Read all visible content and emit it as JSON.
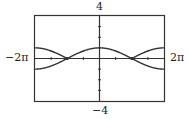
{
  "chart_data": {
    "type": "line",
    "title": "",
    "xlabel": "",
    "ylabel": "",
    "xlim": [
      -6.2832,
      6.2832
    ],
    "ylim": [
      -4,
      4
    ],
    "x_tick_spacing": 1.5708,
    "y_tick_spacing": 1,
    "grid": false,
    "series": [
      {
        "name": "upper curve",
        "expr": "|cos(x/2)|",
        "description": "peaks at 1 at x=0, touches 0 at x=±π, rises to 1 at x=±2π"
      },
      {
        "name": "lower curve",
        "expr": "cos(x/2) for |x|≥π",
        "description": "from 0 at x=±π descends to -1 at x=±2π"
      }
    ],
    "intersections": [
      [
        -3.1416,
        0
      ],
      [
        3.1416,
        0
      ]
    ]
  },
  "labels": {
    "ymax": "4",
    "ymin": "−4",
    "xmin": "−2π",
    "xmax": "2π"
  },
  "colors": {
    "frame": "#333333",
    "curve": "#333333",
    "axis": "#333333"
  }
}
